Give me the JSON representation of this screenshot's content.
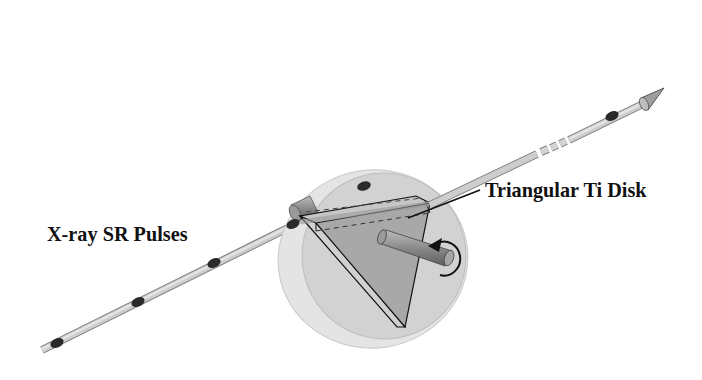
{
  "figure": {
    "labels": {
      "pulses": "X-ray SR Pulses",
      "disk": "Triangular Ti Disk"
    },
    "elements": {
      "beam": "x-ray beam with arrow",
      "pulses_count": 7,
      "disk": "rotating chopper disk",
      "triangle": "triangular Ti disk",
      "shaft": "rotation axle",
      "rotation_arrow": "rotation direction"
    },
    "colors": {
      "beam": "#bdbdbd",
      "pulse": "#2a2a2a",
      "disk_outer": "#e3e3e3",
      "disk_inner": "#cfcfcf",
      "triangle": "#a9a9a9",
      "shaft": "#8e8e8e",
      "line": "#111111"
    }
  }
}
